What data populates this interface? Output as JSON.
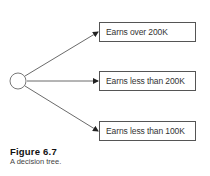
{
  "diagram": {
    "root": {
      "shape": "circle",
      "label": ""
    },
    "branches": [
      {
        "label": "Earns over 200K"
      },
      {
        "label": "Earns less than 200K"
      },
      {
        "label": "Earns less than 100K"
      }
    ],
    "colors": {
      "line": "#444444",
      "box_border": "#555555",
      "text": "#333333"
    }
  },
  "caption": {
    "title": "Figure 6.7",
    "text": "A decision tree."
  }
}
